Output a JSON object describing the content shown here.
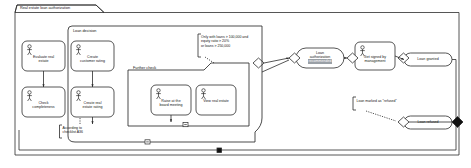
{
  "diagram": {
    "type": "uml-activity-diagram",
    "outer_frame": {
      "title": "Real estate loan authorization"
    },
    "partitions": [
      {
        "name": "loan-decision",
        "title": "Loan decision"
      },
      {
        "name": "further-check",
        "title": "Further check"
      }
    ],
    "activities": [
      {
        "name": "evaluate-real-estate",
        "label": "Evaluate real\nestate",
        "icon": "actor-icon"
      },
      {
        "name": "create-customer-rating",
        "label": "Create\ncustomer rating",
        "icon": "actor-icon"
      },
      {
        "name": "check-completeness",
        "label": "Check\ncompleteness",
        "icon": "actor-icon"
      },
      {
        "name": "create-real-estate-rating",
        "label": "Create real\nestate rating",
        "icon": "actor-icon"
      },
      {
        "name": "raise-at-board-meeting",
        "label": "Raise at the\nboard meeting",
        "icon": "actor-icon"
      },
      {
        "name": "view-real-estate",
        "label": "View real estate",
        "icon": "actor-icon"
      },
      {
        "name": "get-signed-by-management",
        "label": "Get signed by\nmanagement",
        "icon": "actor-icon"
      }
    ],
    "states": [
      {
        "name": "loan-authorization-recommended",
        "line1": "Loan",
        "line2": "authorization",
        "line3": "recommended",
        "selected_line": 3
      },
      {
        "name": "loan-granted",
        "label": "Loan granted"
      },
      {
        "name": "loan-refused",
        "label": "Loan refused"
      }
    ],
    "notes": [
      {
        "name": "note-checklist",
        "text": "According to\nchecklist A36"
      },
      {
        "name": "note-conditions",
        "text": "Only with loans > 100,000 and\nequity ratio > 20%\nor loans > 250,000"
      },
      {
        "name": "note-refused",
        "text": "Loan marked as \"refused\""
      }
    ],
    "decisions": [
      {
        "name": "decision-further-check"
      },
      {
        "name": "decision-authorization"
      },
      {
        "name": "decision-sign-off"
      }
    ],
    "end_nodes": [
      {
        "name": "final-node-main"
      }
    ],
    "collapse_handles": [
      {
        "name": "collapse-handle-further-check"
      },
      {
        "name": "collapse-handle-loan-decision"
      }
    ],
    "lines": {
      "ln1_evaluate": "Evaluate real",
      "ln2_evaluate": "estate",
      "ln1_customer": "Create",
      "ln2_customer": "customer rating",
      "ln1_check": "Check",
      "ln2_check": "completeness",
      "ln1_restate": "Create real",
      "ln2_restate": "estate rating",
      "ln1_raise": "Raise at the",
      "ln2_raise": "board meeting",
      "ln1_view": "View real estate",
      "ln1_signed": "Get signed by",
      "ln2_signed": "management",
      "ln1_auth": "Loan",
      "ln2_auth": "authorization",
      "ln3_auth": "recommended",
      "ln1_granted": "Loan granted",
      "ln1_refused": "Loan refused",
      "note1_l1": "According to",
      "note1_l2": "checklist A36",
      "note2_l1": "Only with loans > 100,000 and",
      "note2_l2": "equity ratio > 20%",
      "note2_l3": "or loans > 250,000",
      "note3_l1": "Loan marked as \"refused\""
    },
    "colors": {
      "stroke": "#2b2b2b",
      "background": "#ffffff",
      "selection": "#9aa0a6",
      "note_stroke": "#2b2b2b"
    }
  }
}
